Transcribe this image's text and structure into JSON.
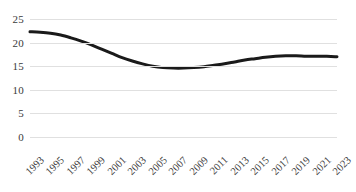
{
  "chart_data": {
    "type": "line",
    "title": "",
    "subtitle": "",
    "xlabel": "",
    "ylabel": "",
    "ylim": [
      0,
      25
    ],
    "y_ticks": [
      0,
      5,
      10,
      15,
      20,
      25
    ],
    "grid": true,
    "legend": false,
    "legend_position": "none",
    "line_color": "#1a1a1a",
    "line_width": 3,
    "smoothed": true,
    "markers": false,
    "x_tick_labels": [
      "1993",
      "1995",
      "1997",
      "1999",
      "2001",
      "2003",
      "2005",
      "2007",
      "2009",
      "2011",
      "2013",
      "2015",
      "2017",
      "2019",
      "2021",
      "2023"
    ],
    "x_tick_rotation_deg": -45,
    "x": [
      1993,
      1994,
      1995,
      1996,
      1997,
      1998,
      1999,
      2000,
      2001,
      2002,
      2003,
      2004,
      2005,
      2006,
      2007,
      2008,
      2009,
      2010,
      2011,
      2012,
      2013,
      2014,
      2015,
      2016,
      2017,
      2018,
      2019,
      2020,
      2021,
      2022,
      2023
    ],
    "values": [
      22.3,
      22.2,
      22.0,
      21.6,
      21.0,
      20.3,
      19.5,
      18.6,
      17.7,
      16.8,
      16.1,
      15.5,
      15.0,
      14.7,
      14.6,
      14.6,
      14.7,
      14.9,
      15.2,
      15.5,
      15.9,
      16.3,
      16.6,
      16.9,
      17.1,
      17.2,
      17.2,
      17.1,
      17.1,
      17.1,
      17.0
    ],
    "series": [
      {
        "name": "series-1",
        "values": [
          22.3,
          22.2,
          22.0,
          21.6,
          21.0,
          20.3,
          19.5,
          18.6,
          17.7,
          16.8,
          16.1,
          15.5,
          15.0,
          14.7,
          14.6,
          14.6,
          14.7,
          14.9,
          15.2,
          15.5,
          15.9,
          16.3,
          16.6,
          16.9,
          17.1,
          17.2,
          17.2,
          17.1,
          17.1,
          17.1,
          17.0
        ]
      }
    ]
  },
  "colors": {
    "line": "#1a1a1a",
    "gridline": "#e0e0e0",
    "tick_text": "#3a3a3a",
    "background": "#ffffff"
  }
}
